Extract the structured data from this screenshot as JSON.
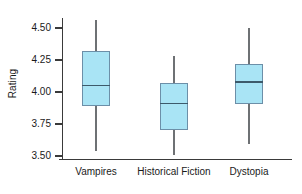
{
  "chart_data": {
    "type": "box",
    "title": "",
    "xlabel": "",
    "ylabel": "Rating",
    "ylim": [
      3.4375,
      4.5625
    ],
    "yticks": [
      3.5,
      3.75,
      4.0,
      4.25,
      4.5
    ],
    "ytick_labels": [
      "3.50",
      "3.75",
      "4.00",
      "4.25",
      "4.50"
    ],
    "grid": false,
    "legend": null,
    "categories": [
      "Vampires",
      "Historical Fiction",
      "Dystopia"
    ],
    "boxes": [
      {
        "category": "Vampires",
        "whisker_low": 3.54,
        "q1": 3.89,
        "median": 4.05,
        "q3": 4.32,
        "whisker_high": 4.56
      },
      {
        "category": "Historical Fiction",
        "whisker_low": 3.51,
        "q1": 3.7,
        "median": 3.91,
        "q3": 4.07,
        "whisker_high": 4.28
      },
      {
        "category": "Dystopia",
        "whisker_low": 3.59,
        "q1": 3.91,
        "median": 4.08,
        "q3": 4.22,
        "whisker_high": 4.5
      }
    ],
    "colors": {
      "box_fill": "#a9e4f5",
      "box_border": "#6c8fa8",
      "median_line": "#3d5a6b",
      "whisker": "#6e7174",
      "axis": "#3a3a3a",
      "text": "#1a1a1a",
      "background": "#ffffff"
    }
  }
}
